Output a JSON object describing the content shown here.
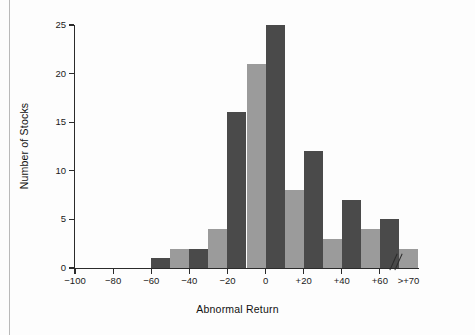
{
  "chart_data": {
    "type": "bar",
    "title": "",
    "xlabel": "Abnormal Return",
    "ylabel": "Number of Stocks",
    "ylim": [
      0,
      25
    ],
    "yticks": [
      0,
      5,
      10,
      15,
      20,
      25
    ],
    "ytick_labels": [
      "0",
      "5",
      "10",
      "15",
      "20",
      "25"
    ],
    "xlim": [
      -100,
      80
    ],
    "xticks": [
      -100,
      -80,
      -60,
      -40,
      -20,
      0,
      20,
      40,
      60
    ],
    "xtick_labels": [
      "−100",
      "−80",
      "−60",
      "−40",
      "−20",
      "0",
      "+20",
      "+40",
      "+60",
      ">+70"
    ],
    "grid": false,
    "legend": "none",
    "bin_width": 10,
    "axis_break": true,
    "axis_break_symbol": "//",
    "categories": [
      "-100 to -90",
      "-90 to -80",
      "-80 to -70",
      "-70 to -60",
      "-60 to -50",
      "-50 to -40",
      "-40 to -30",
      "-30 to -20",
      "-20 to -10",
      "-10 to 0",
      "0 to +10",
      "+10 to +20",
      "+20 to +30",
      "+30 to +40",
      "+40 to +50",
      "+50 to +60",
      "+60 to +70",
      ">+70"
    ],
    "values": [
      0,
      0,
      0,
      0,
      1,
      2,
      2,
      4,
      16,
      21,
      25,
      8,
      12,
      3,
      7,
      4,
      5,
      2
    ],
    "bar_colors": [
      "dark",
      "light",
      "dark",
      "light",
      "dark",
      "light",
      "dark",
      "light",
      "dark",
      "light",
      "dark",
      "light",
      "dark",
      "light",
      "dark",
      "light",
      "dark",
      "light"
    ],
    "colors": {
      "dark_bar": "#4a4a4a",
      "light_bar": "#9b9b9b",
      "axis": "#2b2b2b",
      "background": "#fdfdfd",
      "page_rule": "#b9b9b9"
    }
  }
}
